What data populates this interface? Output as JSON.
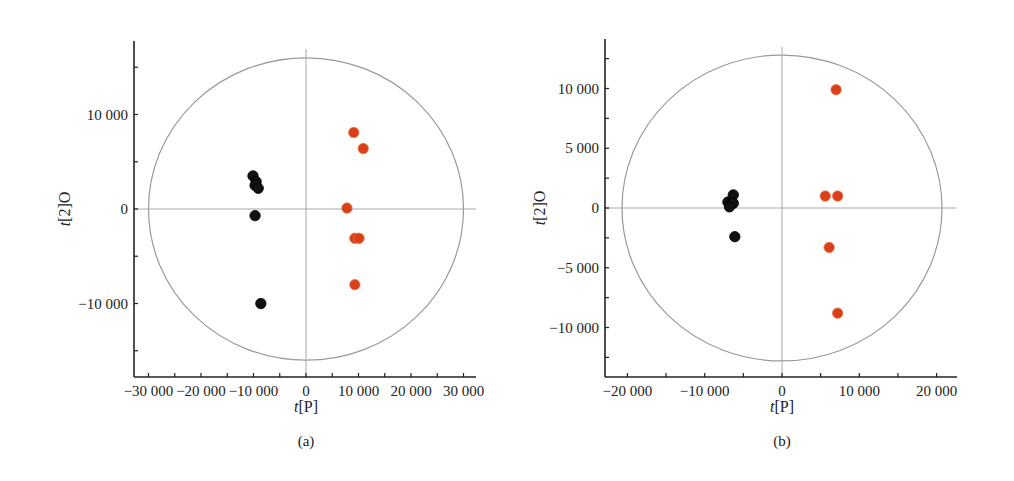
{
  "chart_data": [
    {
      "type": "scatter",
      "panel_label": "(a)",
      "title": "",
      "xlabel": "t[P]",
      "ylabel": "t[2]O",
      "xlim": [
        -33000,
        33000
      ],
      "ylim": [
        -18000,
        18000
      ],
      "x_ticks": [
        -30000,
        -20000,
        -10000,
        0,
        10000,
        20000,
        30000
      ],
      "x_tick_labels": [
        "−30 000",
        "−20 000",
        "−10 000",
        "0",
        "10 000",
        "20 000",
        "30 000"
      ],
      "y_ticks": [
        10000,
        0,
        -10000
      ],
      "y_tick_labels": [
        "10 000",
        "0",
        "−10 000"
      ],
      "hotelling_ellipse": {
        "x_radius": 30000,
        "y_radius": 16000
      },
      "grid": false,
      "legend": null,
      "series": [
        {
          "name": "group 1",
          "color": "#111111",
          "points": [
            [
              -10100,
              3500
            ],
            [
              -9500,
              2900
            ],
            [
              -9700,
              2500
            ],
            [
              -9100,
              2200
            ],
            [
              -9700,
              -700
            ],
            [
              -8600,
              -10000
            ]
          ]
        },
        {
          "name": "group 2",
          "color": "#d8401c",
          "points": [
            [
              9100,
              8100
            ],
            [
              10900,
              6400
            ],
            [
              7800,
              100
            ],
            [
              9300,
              -3100
            ],
            [
              10100,
              -3100
            ],
            [
              9300,
              -8000
            ]
          ]
        }
      ]
    },
    {
      "type": "scatter",
      "panel_label": "(b)",
      "title": "",
      "xlabel": "t[P]",
      "ylabel": "t[2]O",
      "xlim": [
        -22500,
        22500
      ],
      "ylim": [
        -14000,
        14000
      ],
      "x_ticks": [
        -20000,
        -10000,
        0,
        10000,
        20000
      ],
      "x_tick_labels": [
        "−20 000",
        "−10 000",
        "0",
        "10 000",
        "20 000"
      ],
      "y_ticks": [
        10000,
        5000,
        0,
        -5000,
        -10000
      ],
      "y_tick_labels": [
        "10 000",
        "5 000",
        "0",
        "−5 000",
        "−10 000"
      ],
      "hotelling_ellipse": {
        "x_radius": 20700,
        "y_radius": 12800
      },
      "grid": false,
      "legend": null,
      "series": [
        {
          "name": "group 1",
          "color": "#111111",
          "points": [
            [
              -7000,
              500
            ],
            [
              -6700,
              300
            ],
            [
              -6300,
              1100
            ],
            [
              -6300,
              400
            ],
            [
              -6800,
              100
            ],
            [
              -6100,
              -2400
            ]
          ]
        },
        {
          "name": "group 2",
          "color": "#d8401c",
          "points": [
            [
              7000,
              9900
            ],
            [
              5600,
              1000
            ],
            [
              7200,
              1000
            ],
            [
              6100,
              -3300
            ],
            [
              7200,
              -8800
            ]
          ]
        }
      ]
    }
  ]
}
